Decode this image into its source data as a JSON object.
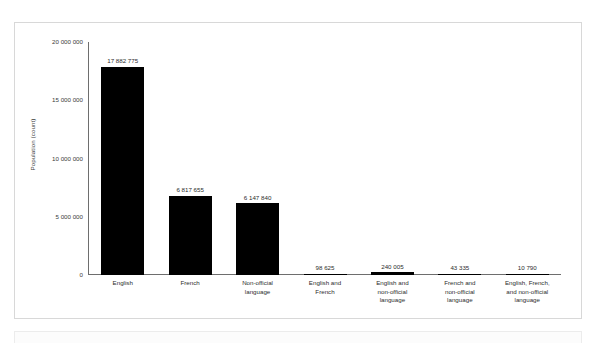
{
  "chart_data": {
    "type": "bar",
    "title": "",
    "subtitle": "",
    "xlabel": "",
    "ylabel": "Population (count)",
    "ylim": [
      0,
      20000000
    ],
    "grid": false,
    "legend": false,
    "categories": [
      "English",
      "French",
      "Non-official language",
      "English and French",
      "English and non-official language",
      "French and non-official language",
      "English, French, and non-official language"
    ],
    "category_lines": [
      [
        "English"
      ],
      [
        "French"
      ],
      [
        "Non-official",
        "language"
      ],
      [
        "English and",
        "French"
      ],
      [
        "English and",
        "non-official",
        "language"
      ],
      [
        "French and",
        "non-official",
        "language"
      ],
      [
        "English, French,",
        "and non-official",
        "language"
      ]
    ],
    "values": [
      17882775,
      6817655,
      6147840,
      98625,
      240005,
      43335,
      10790
    ],
    "value_labels": [
      "17 882 775",
      "6 817 655",
      "6 147 840",
      "98 625",
      "240 005",
      "43 335",
      "10 790"
    ],
    "y_ticks": [
      0,
      5000000,
      10000000,
      15000000,
      20000000
    ],
    "y_tick_labels": [
      "0",
      "5 000 000",
      "10 000 000",
      "15 000 000",
      "20 000 000"
    ],
    "bar_color": "#000000",
    "axis_color": "#6e6e6e",
    "text_color": "#2d2d2d",
    "background_color": "#ffffff"
  }
}
